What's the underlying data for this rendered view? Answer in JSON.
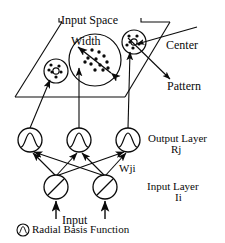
{
  "diagram": {
    "labels": {
      "input_space": "Input Space",
      "width": "Width",
      "center": "Center",
      "pattern": "Pattern",
      "output_layer": "Output Layer",
      "output_layer_symbol": "Rj",
      "weights": "Wji",
      "input_layer": "Input Layer",
      "input_layer_symbol": "Ii",
      "input": "Input",
      "legend_text": "Radial Basis Function"
    },
    "colors": {
      "stroke": "#0a0a0a",
      "background": "#ffffff",
      "fill": "#0a0a0a"
    },
    "input_space_plane": {
      "shape": "parallelogram",
      "points": "62,22 170,22 125,97 15,97"
    },
    "clusters": [
      {
        "name": "cluster-left-small",
        "cx": 56,
        "cy": 71,
        "r": 12,
        "points": [
          [
            51,
            65
          ],
          [
            60,
            66
          ],
          [
            53,
            72
          ],
          [
            62,
            73
          ],
          [
            56,
            77
          ],
          [
            49,
            70
          ]
        ]
      },
      {
        "name": "cluster-center-width",
        "cx": 95,
        "cy": 60,
        "r": 26,
        "points": [
          [
            92,
            50
          ],
          [
            99,
            52
          ],
          [
            88,
            58
          ],
          [
            96,
            59
          ],
          [
            104,
            57
          ],
          [
            91,
            64
          ],
          [
            100,
            65
          ],
          [
            86,
            63
          ],
          [
            108,
            62
          ],
          [
            95,
            70
          ],
          [
            103,
            70
          ]
        ]
      },
      {
        "name": "cluster-right-center",
        "cx": 134,
        "cy": 42,
        "r": 12,
        "points": [
          [
            129,
            36
          ],
          [
            137,
            37
          ],
          [
            131,
            42
          ],
          [
            139,
            43
          ],
          [
            134,
            48
          ],
          [
            127,
            45
          ]
        ]
      }
    ],
    "output_nodes": [
      {
        "name": "output-node-1",
        "cx": 30,
        "cy": 140,
        "r": 12,
        "icon": "rbf-bell-curve-icon"
      },
      {
        "name": "output-node-2",
        "cx": 79,
        "cy": 140,
        "r": 12,
        "icon": "rbf-bell-curve-icon"
      },
      {
        "name": "output-node-3",
        "cx": 128,
        "cy": 140,
        "r": 12,
        "icon": "rbf-bell-curve-icon"
      }
    ],
    "input_nodes": [
      {
        "name": "input-node-1",
        "cx": 56,
        "cy": 187,
        "r": 12,
        "icon": "linear-function-icon"
      },
      {
        "name": "input-node-2",
        "cx": 105,
        "cy": 187,
        "r": 12,
        "icon": "linear-function-icon"
      }
    ],
    "legend_icon": {
      "name": "radial-basis-function-icon",
      "cx": 23,
      "cy": 230,
      "r": 6
    }
  }
}
